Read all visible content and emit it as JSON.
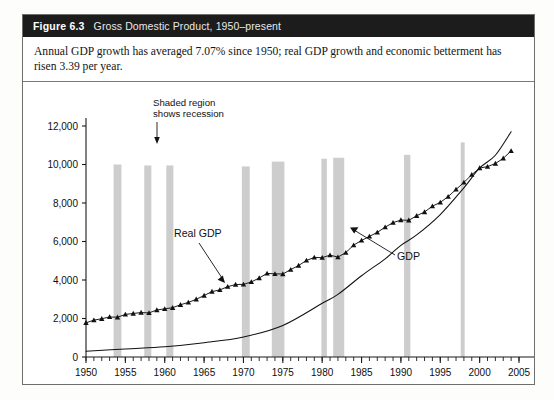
{
  "figure": {
    "number_label": "Figure 6.3",
    "title": "Gross Domestic Product, 1950–present",
    "caption": "Annual GDP growth has averaged 7.07% since 1950; real GDP growth and economic betterment has risen 3.39 per year."
  },
  "annotations": {
    "recession_note_line1": "Shaded region",
    "recession_note_line2": "shows recession",
    "real_gdp_label": "Real GDP",
    "gdp_label": "GDP"
  },
  "colors": {
    "header_bg": "#1c1c1c",
    "header_text": "#ffffff",
    "frame": "#6e6e6e",
    "recession_band": "#c9c9c9",
    "axis": "#1a1a1a",
    "real_gdp_line": "#111111",
    "gdp_line": "#111111",
    "plot_bg": "#ffffff"
  },
  "chart_data": {
    "type": "line",
    "title": "Gross Domestic Product, 1950–present",
    "xlabel": "",
    "ylabel": "",
    "xlim": [
      1950,
      2005
    ],
    "ylim": [
      0,
      12000
    ],
    "ytick_step": 2000,
    "xtick_step": 5,
    "minor_xtick_step": 1,
    "grid": false,
    "legend": "inline-annotations",
    "ytick_labels": [
      "0",
      "2,000",
      "4,000",
      "6,000",
      "8,000",
      "10,000",
      "12,000"
    ],
    "ytick_values": [
      0,
      2000,
      4000,
      6000,
      8000,
      10000,
      12000
    ],
    "xtick_labels": [
      "1950",
      "1955",
      "1960",
      "1965",
      "1970",
      "1975",
      "1980",
      "1985",
      "1990",
      "1995",
      "2000",
      "2005"
    ],
    "xtick_values": [
      1950,
      1955,
      1960,
      1965,
      1970,
      1975,
      1980,
      1985,
      1990,
      1995,
      2000,
      2005
    ],
    "series": [
      {
        "name": "Real GDP",
        "style": "line-with-triangle-markers",
        "x": [
          1950,
          1951,
          1952,
          1953,
          1954,
          1955,
          1956,
          1957,
          1958,
          1959,
          1960,
          1961,
          1962,
          1963,
          1964,
          1965,
          1966,
          1967,
          1968,
          1969,
          1970,
          1971,
          1972,
          1973,
          1974,
          1975,
          1976,
          1977,
          1978,
          1979,
          1980,
          1981,
          1982,
          1983,
          1984,
          1985,
          1986,
          1987,
          1988,
          1989,
          1990,
          1991,
          1992,
          1993,
          1994,
          1995,
          1996,
          1997,
          1998,
          1999,
          2000,
          2001,
          2002,
          2003,
          2004
        ],
        "values": [
          1777,
          1915,
          1988,
          2080,
          2065,
          2213,
          2261,
          2309,
          2290,
          2441,
          2502,
          2560,
          2715,
          2834,
          2999,
          3192,
          3399,
          3485,
          3653,
          3765,
          3772,
          3899,
          4105,
          4342,
          4320,
          4311,
          4541,
          4751,
          5015,
          5173,
          5162,
          5292,
          5189,
          5424,
          5814,
          6054,
          6264,
          6475,
          6743,
          6981,
          7113,
          7101,
          7337,
          7533,
          7836,
          8032,
          8329,
          8704,
          9067,
          9470,
          9817,
          9891,
          10049,
          10321,
          10704
        ]
      },
      {
        "name": "GDP",
        "style": "smooth-line",
        "x": [
          1950,
          1955,
          1960,
          1965,
          1970,
          1975,
          1980,
          1982,
          1985,
          1988,
          1990,
          1992,
          1995,
          1998,
          2000,
          2002,
          2004
        ],
        "values": [
          300,
          420,
          530,
          740,
          1040,
          1640,
          2790,
          3250,
          4220,
          5100,
          5800,
          6340,
          7400,
          8790,
          9820,
          10480,
          11700
        ]
      }
    ],
    "recession_bands": [
      {
        "start": 1953.5,
        "end": 1954.5,
        "top": 10000
      },
      {
        "start": 1957.4,
        "end": 1958.3,
        "top": 9950
      },
      {
        "start": 1960.2,
        "end": 1961.1,
        "top": 9950
      },
      {
        "start": 1969.8,
        "end": 1970.8,
        "top": 9900
      },
      {
        "start": 1973.6,
        "end": 1975.2,
        "top": 10150
      },
      {
        "start": 1979.9,
        "end": 1980.6,
        "top": 10300
      },
      {
        "start": 1981.4,
        "end": 1982.8,
        "top": 10350
      },
      {
        "start": 1990.4,
        "end": 1991.2,
        "top": 10500
      },
      {
        "start": 1997.6,
        "end": 1998.1,
        "top": 11150
      }
    ]
  }
}
